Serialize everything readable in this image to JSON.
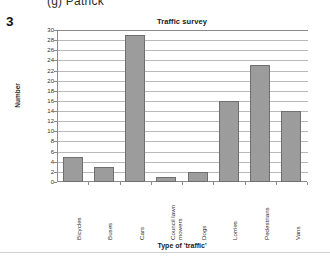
{
  "worksheet": {
    "previous_part_label": "(g)  Patrick",
    "question_number": "3"
  },
  "chart_data": {
    "type": "bar",
    "title": "Traffic survey",
    "xlabel": "Type of 'traffic'",
    "ylabel": "Number",
    "categories": [
      "Bicycles",
      "Buses",
      "Cars",
      "Council lawn\nmowers",
      "Dogs",
      "Lorries",
      "Pedestrians",
      "Vans"
    ],
    "values": [
      5,
      3,
      29,
      1,
      2,
      16,
      23,
      14
    ],
    "ylim": [
      0,
      30
    ],
    "ytick_step": 2,
    "yticks": [
      30,
      28,
      26,
      24,
      22,
      20,
      18,
      16,
      14,
      12,
      10,
      8,
      6,
      4,
      2,
      0
    ],
    "grid": true,
    "legend": false,
    "bar_color": "#9c9c9c",
    "bar_border_color": "#6f6f6f",
    "gridline_color": "#b9b9b9",
    "axis_color": "#8a8a8a"
  }
}
